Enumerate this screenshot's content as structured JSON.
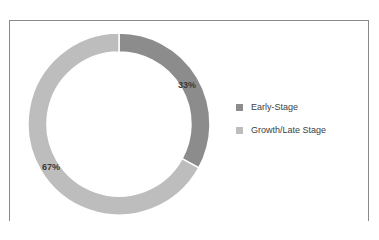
{
  "chart_data": {
    "type": "pie",
    "variant": "donut",
    "title": "",
    "categories": [
      "Early-Stage",
      "Growth/Late Stage"
    ],
    "values": [
      33,
      67
    ],
    "value_labels": [
      "33%",
      "67%"
    ],
    "colors": [
      "#8c8c8c",
      "#bdbdbd"
    ],
    "legend_position": "right",
    "start_angle_deg": 0,
    "direction": "clockwise"
  },
  "legend": {
    "items": [
      {
        "label": "Early-Stage",
        "color": "#8c8c8c"
      },
      {
        "label": "Growth/Late Stage",
        "color": "#bdbdbd"
      }
    ]
  },
  "labels": {
    "early": "33%",
    "growth": "67%"
  }
}
